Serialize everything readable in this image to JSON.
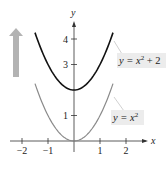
{
  "chart_data": {
    "type": "line",
    "title": "",
    "xlabel": "x",
    "ylabel": "y",
    "xlim": [
      -2.5,
      2.8
    ],
    "ylim": [
      -0.8,
      5
    ],
    "x_ticks": [
      -2,
      -1,
      1,
      2
    ],
    "x_tick_labels": [
      "−2",
      "−1",
      "1",
      "2"
    ],
    "y_ticks": [
      1,
      3,
      4
    ],
    "y_tick_labels": [
      "1",
      "3",
      "4"
    ],
    "grid": false,
    "series": [
      {
        "name": "y = x² + 2",
        "function": "x^2 + 2",
        "x_range": [
          -1.5,
          1.5
        ],
        "color": "#111111",
        "shift": 2
      },
      {
        "name": "y = x²",
        "function": "x^2",
        "x_range": [
          -1.5,
          1.5
        ],
        "color": "#8a8a8a",
        "shift": 0
      }
    ],
    "annotations": [
      {
        "text": "y = x² + 2",
        "series": 0
      },
      {
        "text": "y = x²",
        "series": 1
      },
      {
        "type": "arrow",
        "direction": "up",
        "meaning": "vertical shift upward",
        "color": "#b0b0b0"
      }
    ]
  },
  "labels": {
    "top_curve": {
      "pre": "y = x",
      "sup": "2",
      "post": " + 2"
    },
    "bottom_curve": {
      "pre": "y = x",
      "sup": "2",
      "post": ""
    },
    "x_axis": "x",
    "y_axis": "y"
  },
  "colors": {
    "label_bg": "#ececec",
    "shift_arrow": "#b3b3b3",
    "axis": "#333333"
  }
}
